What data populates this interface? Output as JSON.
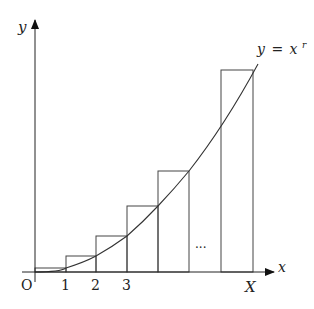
{
  "diagram": {
    "axes": {
      "x_label": "x",
      "y_label": "y",
      "origin_label": "O"
    },
    "curve_label": "y = x^r",
    "curve_label_parts": {
      "lhs": "y",
      "eq": "=",
      "base": "x",
      "exp": "r"
    },
    "tick_labels": [
      "1",
      "2",
      "3",
      "X"
    ],
    "ellipsis": "···",
    "rectangles": [
      {
        "x0": 0,
        "x1": 1,
        "height_at": "right"
      },
      {
        "x0": 1,
        "x1": 2,
        "height_at": "right"
      },
      {
        "x0": 2,
        "x1": 3,
        "height_at": "right"
      },
      {
        "x0": 3,
        "x1": 4,
        "height_at": "right"
      },
      {
        "x0": 4,
        "x1": 5,
        "height_at": "right"
      },
      {
        "x0": "X-1",
        "x1": "X",
        "height_at": "right"
      }
    ],
    "colors": {
      "line": "#333333",
      "background": "#ffffff"
    }
  }
}
